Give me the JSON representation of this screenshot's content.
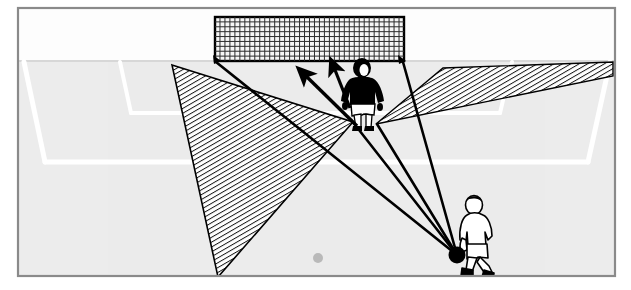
{
  "figure": {
    "kind": "soccer-tactics-diagram",
    "caption": "",
    "border_color": "#8a8a8a",
    "background_color": "#ffffff",
    "pitch_color": "#ececec",
    "pitch_line_color": "#ffffff",
    "ink_color": "#000000",
    "hatch_color": "#1a1a1a"
  },
  "frame": {
    "x": 17,
    "y": 7,
    "width": 599,
    "height": 270,
    "stroke_width": 2
  },
  "pitch": {
    "goal_line_y": 61,
    "surface_top": 61,
    "surface_bottom": 276,
    "penalty_area": {
      "left_top_x": 24,
      "left_bottom_x": 45,
      "right_top_x": 610,
      "right_bottom_x": 588,
      "front_line_y": 160,
      "line_width": 5
    },
    "six_yard_box": {
      "left_top_x": 120,
      "left_bottom_x": 131,
      "right_top_x": 512,
      "right_bottom_x": 500,
      "front_line_y": 112,
      "line_width": 4
    },
    "penalty_spot": {
      "cx": 318,
      "cy": 258,
      "r": 5,
      "color": "#b4b4b4"
    }
  },
  "goal": {
    "label": "goal-with-net",
    "left_post_x": 215,
    "right_post_x": 404,
    "crossbar_y": 17,
    "goal_mouth_y": 61,
    "frame_stroke": "#000000",
    "net": {
      "columns": 38,
      "rows": 9,
      "mesh_color": "#2c2c2c",
      "fill": "#f4f4f4"
    },
    "left_post_base": {
      "x": 215,
      "y": 61
    },
    "right_post_base": {
      "x": 404,
      "y": 61
    }
  },
  "ball": {
    "label": "ball-at-attackers-feet",
    "cx": 457,
    "cy": 255,
    "r": 8,
    "color": "#000000"
  },
  "goalkeeper": {
    "label": "goalkeeper",
    "shirt_color": "#000000",
    "shorts_color": "#ffffff",
    "skin_color": "#ffffff",
    "x": 362,
    "y": 60,
    "height": 72,
    "feet_y": 128
  },
  "attacker": {
    "label": "attacking-player",
    "outline_color": "#000000",
    "fill_color": "#ffffff",
    "x": 474,
    "y": 196,
    "height": 78
  },
  "sight_lines": [
    {
      "name": "ball-to-left-post",
      "x1": 457,
      "y1": 255,
      "x2": 215,
      "y2": 61
    },
    {
      "name": "ball-to-right-post",
      "x1": 457,
      "y1": 255,
      "x2": 404,
      "y2": 61
    },
    {
      "name": "ball-past-keeper-left",
      "x1": 457,
      "y1": 255,
      "x2": 353,
      "y2": 122
    },
    {
      "name": "ball-past-keeper-right",
      "x1": 457,
      "y1": 255,
      "x2": 376,
      "y2": 124
    }
  ],
  "shadow_regions": [
    {
      "name": "left-blocked-zone",
      "points": "172,65 353,122 218,277",
      "hatch": "diagonal"
    },
    {
      "name": "right-blocked-zone",
      "points": "376,124 443,68 613,63 613,74",
      "hatch": "diagonal"
    }
  ],
  "movement_arrows": [
    {
      "name": "keeper-advance-arrow-long",
      "x1": 357,
      "y1": 125,
      "x2": 303,
      "y2": 72
    },
    {
      "name": "keeper-advance-arrow-short",
      "x1": 347,
      "y1": 102,
      "x2": 331,
      "y2": 62
    }
  ],
  "hatch": {
    "spacing": 4.2,
    "stroke_width": 1.9,
    "angle_deg": 60
  }
}
